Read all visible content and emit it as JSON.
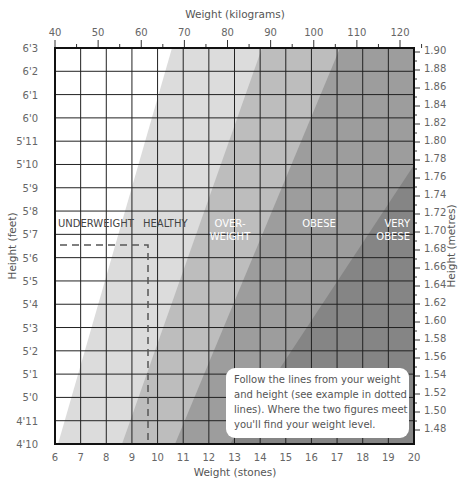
{
  "chart_data": {
    "type": "heatmap",
    "title": "",
    "top_axis": {
      "label": "Weight (kilograms)",
      "ticks": [
        "40",
        "50",
        "60",
        "70",
        "80",
        "90",
        "100",
        "110",
        "120"
      ],
      "range": [
        40,
        127
      ]
    },
    "bottom_axis": {
      "label": "Weight (stones)",
      "ticks": [
        "6",
        "7",
        "8",
        "9",
        "10",
        "11",
        "12",
        "13",
        "14",
        "15",
        "16",
        "17",
        "18",
        "19",
        "20"
      ],
      "range": [
        6,
        20
      ]
    },
    "left_axis": {
      "label": "Height (feet)",
      "ticks": [
        "6'3",
        "6'2",
        "6'1",
        "6'0",
        "5'11",
        "5'10",
        "5'9",
        "5'8",
        "5'7",
        "5'6",
        "5'5",
        "5'4",
        "5'3",
        "5'2",
        "5'1",
        "5'0",
        "4'11",
        "4'10"
      ]
    },
    "right_axis": {
      "label": "Height (metres)",
      "ticks": [
        "1.90",
        "1.88",
        "1.86",
        "1.84",
        "1.82",
        "1.80",
        "1.78",
        "1.76",
        "1.74",
        "1.72",
        "1.70",
        "1.68",
        "1.66",
        "1.64",
        "1.62",
        "1.60",
        "1.58",
        "1.56",
        "1.54",
        "1.52",
        "1.50",
        "1.48"
      ],
      "range": [
        1.47,
        1.905
      ]
    },
    "categories": [
      "UNDERWEIGHT",
      "HEALTHY",
      "OVER-WEIGHT",
      "OBESE",
      "VERY OBESE"
    ],
    "band_colors": [
      "#ffffff",
      "#dcdcdc",
      "#bdbdbd",
      "#9d9d9d",
      "#858585"
    ],
    "example": {
      "weight_stones": 9.7,
      "height_feet": "5'6.6",
      "category": "HEALTHY"
    },
    "grid": true
  },
  "labels": {
    "top_axis_title": "Weight (kilograms)",
    "bottom_axis_title": "Weight (stones)",
    "left_axis_title": "Height (feet)",
    "right_axis_title": "Height (metres)",
    "underweight": "UNDERWEIGHT",
    "healthy": "HEALTHY",
    "overweight_1": "OVER-",
    "overweight_2": "WEIGHT",
    "obese": "OBESE",
    "very_obese_1": "VERY",
    "very_obese_2": "OBESE"
  },
  "note": "Follow the lines from your weight and height (see example in dotted lines). Where the two figures meet you'll find your weight level."
}
